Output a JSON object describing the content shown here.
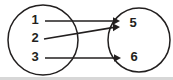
{
  "figure": {
    "type": "mapping-diagram",
    "background_color": "#ffffff",
    "stroke_color": "#221f1f",
    "label_color": "#231f20",
    "bottom_band_color": "#d7d7d7",
    "width": 173,
    "height": 80
  },
  "sets": {
    "domain": {
      "name": "domain-set",
      "shape": "circle",
      "center_x": 43,
      "center_y": 40,
      "radius_x": 35,
      "radius_y": 35,
      "elements": [
        {
          "label": "1",
          "x": 35,
          "y": 21
        },
        {
          "label": "2",
          "x": 35,
          "y": 39
        },
        {
          "label": "3",
          "x": 35,
          "y": 58
        }
      ]
    },
    "codomain": {
      "name": "codomain-set",
      "shape": "circle",
      "center_x": 139,
      "center_y": 40,
      "radius_x": 31,
      "radius_y": 32,
      "elements": [
        {
          "label": "5",
          "x": 133,
          "y": 24
        },
        {
          "label": "6",
          "x": 134,
          "y": 58
        }
      ]
    }
  },
  "mappings": [
    {
      "name": "arrow-1-to-5",
      "from": "1",
      "to": "5",
      "x1": 45,
      "y1": 21,
      "x2": 118,
      "y2": 21
    },
    {
      "name": "arrow-2-to-5",
      "from": "2",
      "to": "5",
      "x1": 44,
      "y1": 39,
      "x2": 118,
      "y2": 27
    },
    {
      "name": "arrow-3-to-6",
      "from": "3",
      "to": "6",
      "x1": 45,
      "y1": 58,
      "x2": 120,
      "y2": 58
    }
  ]
}
